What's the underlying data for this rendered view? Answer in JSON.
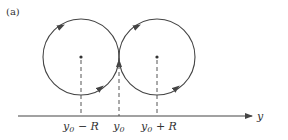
{
  "panel_label": "(a)",
  "axis": {
    "label": "y",
    "y": 116,
    "x_start": 18,
    "x_end": 252
  },
  "circles": [
    {
      "name": "left-circle",
      "cx": 81,
      "cy": 57,
      "r": 38
    },
    {
      "name": "right-circle",
      "cx": 157,
      "cy": 57,
      "r": 38
    }
  ],
  "tick_labels": [
    {
      "x": 81,
      "base": "y",
      "sub": "0",
      "suffix": " − R"
    },
    {
      "x": 119,
      "base": "y",
      "sub": "0",
      "suffix": ""
    },
    {
      "x": 157,
      "base": "y",
      "sub": "0",
      "suffix": " + R"
    }
  ],
  "dashed_lines": [
    {
      "x": 81,
      "y1": 59,
      "y2": 116
    },
    {
      "x": 119,
      "y1": 57,
      "y2": 116
    },
    {
      "x": 157,
      "y1": 59,
      "y2": 116
    }
  ],
  "colors": {
    "stroke": "#444444",
    "text": "#333333",
    "background": "#ffffff"
  }
}
